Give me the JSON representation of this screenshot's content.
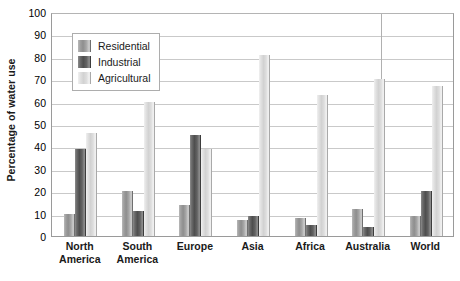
{
  "chart_data": {
    "type": "bar",
    "title": "",
    "subtitle": "",
    "xlabel": "",
    "ylabel": "Percentage of water use",
    "ylim": [
      0,
      100
    ],
    "ytick_step": 10,
    "yticks": [
      100,
      90,
      80,
      70,
      60,
      50,
      40,
      30,
      20,
      10,
      0
    ],
    "grid": "horizontal",
    "legend_position": "inside-top-left",
    "categories": [
      "North America",
      "South America",
      "Europe",
      "Asia",
      "Africa",
      "Australia",
      "World"
    ],
    "category_lines": [
      [
        "North",
        "America"
      ],
      [
        "South",
        "America"
      ],
      [
        "Europe",
        ""
      ],
      [
        "Asia",
        ""
      ],
      [
        "Africa",
        ""
      ],
      [
        "Australia",
        ""
      ],
      [
        "World",
        ""
      ]
    ],
    "series": [
      {
        "name": "Residential",
        "color": "#9e9e9e",
        "values": [
          10,
          20,
          14,
          7,
          8,
          12,
          9
        ]
      },
      {
        "name": "Industrial",
        "color": "#525252",
        "values": [
          39,
          11,
          45,
          9,
          5,
          4,
          20
        ]
      },
      {
        "name": "Agricultural",
        "color": "#dcdcdc",
        "values": [
          46,
          60,
          39,
          81,
          63,
          70,
          67
        ]
      }
    ]
  },
  "legend": {
    "items": [
      {
        "label": "Residential"
      },
      {
        "label": "Industrial"
      },
      {
        "label": "Agricultural"
      }
    ]
  },
  "axes": {
    "y_title": "Percentage of water use"
  },
  "colors": {
    "plot_border": "#9a9a9a",
    "gridline": "#c9c9c9",
    "background": "#ffffff",
    "text": "#1a1a1a"
  }
}
